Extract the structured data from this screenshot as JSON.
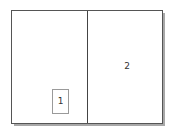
{
  "diagram": {
    "panels": [
      {
        "id": "left",
        "label": ""
      },
      {
        "id": "right",
        "label": "2"
      }
    ],
    "inner_box": {
      "label": "1"
    },
    "colors": {
      "frame_border": "#555555",
      "divider": "#444444",
      "shadow": "#a8a8a8",
      "inner_box_border": "#9a9a9a",
      "text": "#333333",
      "background": "#ffffff"
    }
  }
}
